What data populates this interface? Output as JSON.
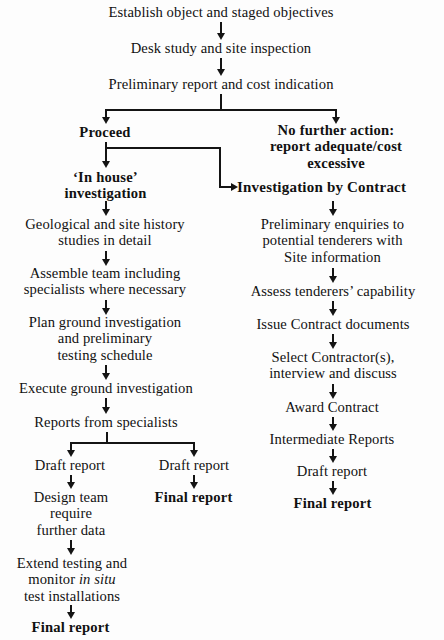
{
  "diagram": {
    "type": "flowchart",
    "background_color": "#fdfdfd",
    "line_color": "#141414",
    "text_color": "#111111",
    "stages": {
      "establish": "Establish object and staged objectives",
      "desk_study": "Desk study and site inspection",
      "preliminary_report": "Preliminary report and cost indication",
      "proceed": "Proceed",
      "no_further_action": "No further action:\nreport adequate/cost\nexcessive",
      "in_house": "‘In house’\ninvestigation",
      "by_contract": "Investigation by Contract"
    },
    "in_house_branch": [
      "Geological and site history\nstudies in detail",
      "Assemble team including\nspecialists where necessary",
      "Plan ground investigation\nand preliminary\ntesting schedule",
      "Execute ground investigation",
      "Reports from specialists"
    ],
    "in_house_left_tail": {
      "draft_report": "Draft report",
      "design_team": "Design team\nrequire\nfurther data",
      "extend_testing_pre": "Extend testing and\nmonitor ",
      "extend_testing_italic": "in situ",
      "extend_testing_post": "\ntest installations",
      "final_report": "Final report"
    },
    "in_house_right_tail": {
      "draft_report": "Draft report",
      "final_report": "Final report"
    },
    "contract_branch": [
      "Preliminary enquiries to\npotential tenderers with\nSite information",
      "Assess tenderers’ capability",
      "Issue Contract documents",
      "Select Contractor(s),\ninterview and discuss",
      "Award Contract",
      "Intermediate Reports",
      "Draft report"
    ],
    "contract_final": "Final report"
  }
}
